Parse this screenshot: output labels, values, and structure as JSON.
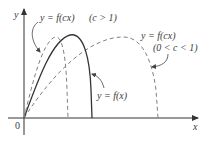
{
  "figure": {
    "type": "function-transformation-diagram",
    "axes": {
      "x_label": "x",
      "y_label": "y",
      "origin_label": "0"
    },
    "curves": [
      {
        "id": "original",
        "label": "y = f(x)",
        "style": "solid",
        "color": "#333333"
      },
      {
        "id": "compressed",
        "label": "y = f(cx)",
        "condition": "(c > 1)",
        "style": "dashed",
        "color": "#777777"
      },
      {
        "id": "stretched",
        "label": "y = f(cx)",
        "condition": "(0 < c < 1)",
        "style": "dashed",
        "color": "#777777"
      }
    ],
    "labels": {
      "compressed_eq": "y = f(cx)",
      "compressed_cond": "(c > 1)",
      "stretched_eq": "y = f(cx)",
      "stretched_cond": "(0 < c < 1)",
      "original_eq": "y = f(x)"
    },
    "colors": {
      "axis": "#333333",
      "solid_curve": "#333333",
      "dashed_curve": "#808080",
      "text": "#3a3a3a"
    }
  }
}
